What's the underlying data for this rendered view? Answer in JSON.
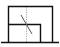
{
  "icon": {
    "name": "section-view-icon",
    "stroke_color": "#111111",
    "guide_color": "#9a9a9a",
    "background": "#ffffff"
  }
}
